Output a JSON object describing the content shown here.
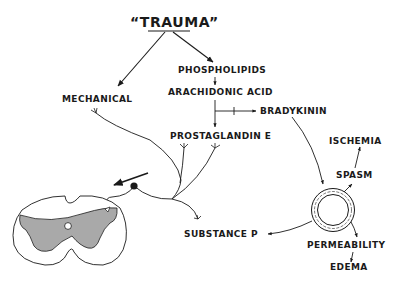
{
  "diagram": {
    "title": "“TRAUMA”",
    "nodes": {
      "mechanical": "MECHANICAL",
      "phospholipids": "PHOSPHOLIPIDS",
      "arachidonic_acid": "ARACHIDONIC ACID",
      "bradykinin": "BRADYKININ",
      "prostaglandin_e": "PROSTAGLANDIN  E",
      "ischemia": "ISCHEMIA",
      "spasm": "SPASM",
      "substance_p": "SUBSTANCE  P",
      "permeability": "PERMEABILITY",
      "edema": "EDEMA"
    },
    "inhibition_mark": "+",
    "edges": [
      {
        "from": "trauma",
        "to": "mechanical"
      },
      {
        "from": "trauma",
        "to": "phospholipids"
      },
      {
        "from": "phospholipids",
        "to": "arachidonic_acid"
      },
      {
        "from": "arachidonic_acid",
        "to": "bradykinin",
        "marker": "+"
      },
      {
        "from": "arachidonic_acid",
        "to": "prostaglandin_e"
      },
      {
        "from": "bradykinin",
        "to": "blood_vessel"
      },
      {
        "from": "blood_vessel",
        "to": "spasm"
      },
      {
        "from": "spasm",
        "to": "ischemia"
      },
      {
        "from": "blood_vessel",
        "to": "permeability"
      },
      {
        "from": "permeability",
        "to": "edema"
      },
      {
        "from": "blood_vessel",
        "to": "substance_p"
      },
      {
        "from": "nerve_endings",
        "to": "spinal_cord"
      }
    ],
    "figures": {
      "blood_vessel": "blood-vessel-cross-section",
      "spinal_cord": "spinal-cord-cross-section",
      "neuron": "sensory-neuron-cell-body"
    },
    "colors": {
      "ink": "#1a1a1a",
      "gray_matter": "#a9a9a9",
      "background": "#ffffff"
    }
  }
}
